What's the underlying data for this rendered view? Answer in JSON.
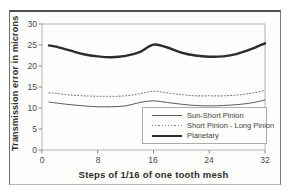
{
  "figure": {
    "background": "#fdfdfb",
    "frame_border_color": "#6e6e6e",
    "plot_border_color": "#b3b3b3",
    "tick_color": "#8a8a8a"
  },
  "chart_data": {
    "type": "line",
    "title": "",
    "xlabel": "Steps of 1/16 of one tooth mesh",
    "ylabel": "Transmission error in microns",
    "xlim": [
      0,
      32
    ],
    "ylim": [
      0,
      30
    ],
    "xticks": [
      0,
      8,
      16,
      24,
      32
    ],
    "yticks": [
      0,
      5,
      10,
      15,
      20,
      25,
      30
    ],
    "grid": false,
    "legend_position": "inside-bottom-right",
    "x": [
      1,
      2,
      4,
      6,
      8,
      10,
      12,
      14,
      16,
      18,
      20,
      22,
      24,
      26,
      28,
      30,
      32
    ],
    "series": [
      {
        "name": "Sun-Short Pinion",
        "line_style": "solid",
        "line_width": 1,
        "color": "#5a5a5a",
        "values": [
          11.4,
          11.2,
          10.8,
          10.5,
          10.3,
          10.3,
          10.5,
          11.3,
          11.7,
          11.3,
          10.9,
          10.6,
          10.5,
          10.6,
          10.8,
          11.2,
          11.9
        ]
      },
      {
        "name": "Short Pinion - Long Pinion",
        "line_style": "dotted",
        "line_width": 1.1,
        "color": "#7f7f7f",
        "values": [
          13.6,
          13.5,
          13.1,
          12.9,
          12.8,
          12.8,
          12.9,
          13.4,
          14.0,
          13.6,
          13.2,
          12.9,
          12.9,
          12.9,
          13.1,
          13.5,
          14.2
        ]
      },
      {
        "name": "Planetary",
        "line_style": "solid",
        "line_width": 2.4,
        "color": "#2c2c2c",
        "values": [
          24.9,
          24.6,
          23.7,
          22.8,
          22.3,
          22.1,
          22.4,
          23.3,
          25.1,
          24.4,
          23.2,
          22.5,
          22.2,
          22.3,
          22.9,
          24.0,
          25.4
        ]
      }
    ]
  }
}
